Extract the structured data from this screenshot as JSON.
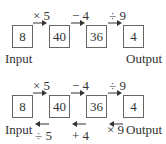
{
  "diagram": {
    "rows": [
      {
        "boxes": [
          "8",
          "40",
          "36",
          "4"
        ],
        "forward_ops": [
          "× 5",
          "− 4",
          "÷ 9"
        ],
        "reverse_ops": [],
        "input_label": "Input",
        "output_label": "Output"
      },
      {
        "boxes": [
          "8",
          "40",
          "36",
          "4"
        ],
        "forward_ops": [
          "× 5",
          "− 4",
          "÷ 9"
        ],
        "reverse_ops": [
          "÷ 5",
          "+ 4",
          "× 9"
        ],
        "input_label": "Input",
        "output_label": "Output"
      }
    ],
    "colors": {
      "text": "#333333",
      "box_border": "#666666",
      "background": "#ffffff"
    }
  }
}
